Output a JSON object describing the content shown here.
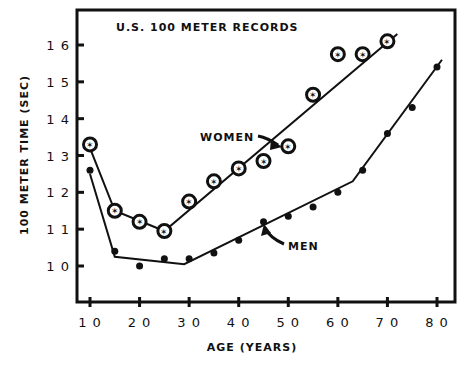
{
  "chart_data": {
    "type": "scatter",
    "title": "U.S. 100 METER RECORDS",
    "xlabel": "AGE (YEARS)",
    "ylabel": "100 METER TIME (SEC)",
    "xlim": [
      8,
      84
    ],
    "ylim": [
      9,
      17
    ],
    "xticks": [
      10,
      20,
      30,
      40,
      50,
      60,
      70,
      80
    ],
    "yticks": [
      10,
      11,
      12,
      13,
      14,
      15,
      16
    ],
    "grid": false,
    "legend": "annotations",
    "annotations": [
      "WOMEN",
      "MEN"
    ],
    "series": [
      {
        "name": "WOMEN",
        "marker": "open-circle-star",
        "x": [
          10,
          15,
          20,
          25,
          30,
          35,
          40,
          45,
          50,
          55,
          60,
          65,
          70
        ],
        "y": [
          13.3,
          11.5,
          11.2,
          10.95,
          11.75,
          12.3,
          12.65,
          12.85,
          13.25,
          14.65,
          15.75,
          15.75,
          16.1
        ],
        "fit": [
          [
            10,
            13.2
          ],
          [
            15,
            11.5
          ],
          [
            25,
            10.95
          ],
          [
            72,
            16.3
          ]
        ]
      },
      {
        "name": "MEN",
        "marker": "filled-circle",
        "x": [
          10,
          15,
          20,
          25,
          30,
          35,
          40,
          45,
          50,
          55,
          60,
          65,
          70,
          75,
          80
        ],
        "y": [
          12.6,
          10.4,
          10.0,
          10.2,
          10.2,
          10.35,
          10.7,
          11.2,
          11.35,
          11.6,
          12.0,
          12.6,
          13.6,
          14.3,
          15.4
        ],
        "fit": [
          [
            10,
            12.5
          ],
          [
            15,
            10.25
          ],
          [
            29,
            10.05
          ],
          [
            63,
            12.3
          ],
          [
            81,
            15.6
          ]
        ]
      }
    ]
  }
}
